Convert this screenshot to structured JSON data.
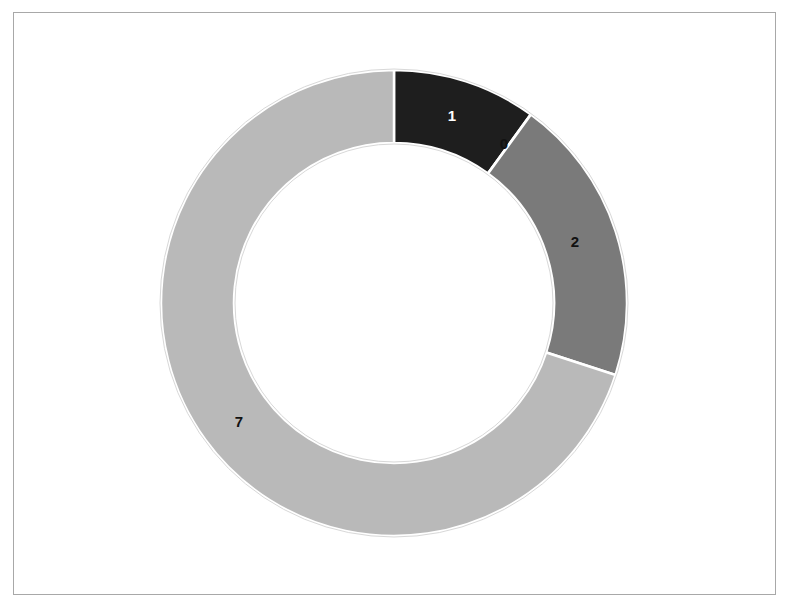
{
  "chart_data": {
    "type": "pie",
    "variant": "donut",
    "title": "",
    "categories": [
      "A",
      "B",
      "C",
      "D"
    ],
    "values": [
      1,
      0,
      2,
      7
    ],
    "data_labels": [
      "1",
      "0",
      "2",
      "7"
    ],
    "colors": [
      "#1e1e1e",
      "#ffffff",
      "#7a7a7a",
      "#b9b9b9"
    ],
    "label_colors": [
      "#ffffff",
      "#111111",
      "#111111",
      "#111111"
    ],
    "start_angle_deg": 0,
    "direction": "clockwise",
    "legend": "none",
    "hole_ratio": 0.69
  },
  "labels": {
    "slice1": "1",
    "slice2": "0",
    "slice3": "2",
    "slice4": "7"
  }
}
